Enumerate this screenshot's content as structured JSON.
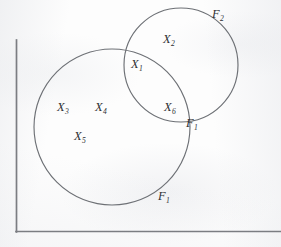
{
  "figure": {
    "background_color": "#fdfdfd",
    "line_color": "#6d7075",
    "axis_color": "#7b7d82",
    "text_color": "#2e3033"
  },
  "axes": {
    "vertical": {
      "x": 16,
      "y_top": 40,
      "y_bottom": 232
    },
    "horizontal": {
      "y": 232,
      "x_left": 16,
      "x_right": 281
    }
  },
  "sets": [
    {
      "id": "F1",
      "name": "large-set-circle",
      "label": "F",
      "subscript": "1",
      "cx": 112,
      "cy": 127,
      "r": 78
    },
    {
      "id": "F2",
      "name": "small-set-circle",
      "label": "F",
      "subscript": "2",
      "cx": 181,
      "cy": 65,
      "r": 57
    }
  ],
  "point_labels": [
    {
      "id": "X1",
      "label": "X",
      "subscript": "1",
      "x": 131,
      "y": 58,
      "region": "intersection"
    },
    {
      "id": "X2",
      "label": "X",
      "subscript": "2",
      "x": 163,
      "y": 33,
      "region": "F2-only"
    },
    {
      "id": "X3",
      "label": "X",
      "subscript": "3",
      "x": 57,
      "y": 101,
      "region": "F1-only"
    },
    {
      "id": "X4",
      "label": "X",
      "subscript": "4",
      "x": 95,
      "y": 101,
      "region": "F1-only"
    },
    {
      "id": "X5",
      "label": "X",
      "subscript": "5",
      "x": 74,
      "y": 130,
      "region": "F1-only"
    },
    {
      "id": "X6",
      "label": "X",
      "subscript": "6",
      "x": 164,
      "y": 101,
      "region": "intersection"
    }
  ],
  "set_labels": [
    {
      "id": "F2-outer",
      "label": "F",
      "subscript": "2",
      "x": 212,
      "y": 8,
      "target": "F2"
    },
    {
      "id": "F1-node",
      "label": "F",
      "subscript": "1",
      "x": 186,
      "y": 117,
      "target": "F1"
    },
    {
      "id": "F1-outer",
      "label": "F",
      "subscript": "1",
      "x": 158,
      "y": 190,
      "target": "F1"
    }
  ]
}
